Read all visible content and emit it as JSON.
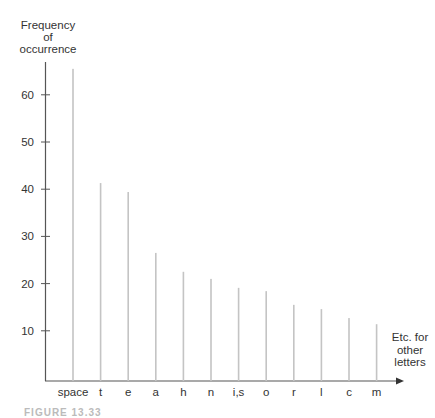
{
  "chart_data": {
    "type": "bar",
    "title": "",
    "ylabel": "Frequency of occurrence",
    "ylabel_lines": [
      "Frequency",
      "of",
      "occurrence"
    ],
    "xlabel": "",
    "categories": [
      "space",
      "t",
      "e",
      "a",
      "h",
      "n",
      "i,s",
      "o",
      "r",
      "l",
      "c",
      "m"
    ],
    "values": [
      65.5,
      41.3,
      39.4,
      26.5,
      22.5,
      21,
      19.1,
      18.4,
      15.5,
      14.6,
      12.7,
      11.4
    ],
    "yticks": [
      10,
      20,
      30,
      40,
      50,
      60
    ],
    "ytick_labels": [
      "10",
      "20",
      "30",
      "40",
      "50",
      "60"
    ],
    "ylim": [
      0,
      68
    ],
    "grid": false,
    "legend": null,
    "annotation": [
      "Etc. for",
      "other",
      "letters"
    ],
    "caption": "FIGURE 13.33",
    "colors": {
      "bar": "#c4c4c4",
      "axis": "#555555",
      "text": "#333333"
    }
  }
}
